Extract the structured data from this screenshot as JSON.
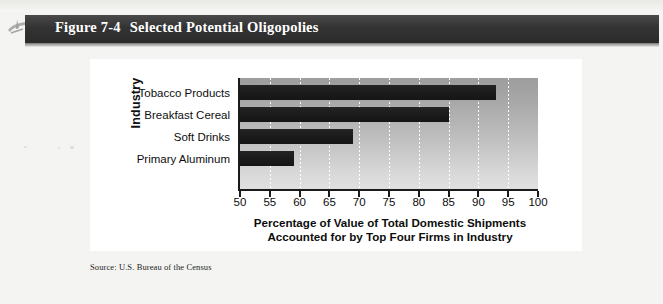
{
  "figure": {
    "number_label": "Figure 7-4",
    "title": "Selected Potential Oligopolies",
    "source": "Source: U.S. Bureau of the Census",
    "band_glyph_name": "book-ornament-icon"
  },
  "colors": {
    "band_background": "#333333",
    "band_text": "#ffffff",
    "bar_fill": "#1b1b1b",
    "plot_top": "#9d9d9d",
    "plot_bottom": "#e0e0e0",
    "gridline": "#ffffff",
    "axis": "#1a1a1a",
    "page_background": "#f4f4f2",
    "card_background": "#ffffff"
  },
  "chart_data": {
    "type": "bar",
    "orientation": "horizontal",
    "title": "Selected Potential Oligopolies",
    "categories": [
      "Tobacco Products",
      "Breakfast Cereal",
      "Soft Drinks",
      "Primary Aluminum"
    ],
    "values": [
      93,
      85,
      69,
      59
    ],
    "xlabel": "Percentage of Value of Total Domestic Shipments Accounted for by Top Four Firms in Industry",
    "xlabel_line1": "Percentage of Value of Total Domestic Shipments",
    "xlabel_line2": "Accounted for by Top Four Firms in Industry",
    "ylabel": "Industry",
    "xlim": [
      50,
      100
    ],
    "xticks": [
      50,
      55,
      60,
      65,
      70,
      75,
      80,
      85,
      90,
      95,
      100
    ],
    "xtick_labels": [
      "50",
      "55",
      "60",
      "65",
      "70",
      "75",
      "80",
      "85",
      "90",
      "95",
      "100"
    ],
    "grid": "vertical-dotted-white",
    "legend": "none"
  }
}
